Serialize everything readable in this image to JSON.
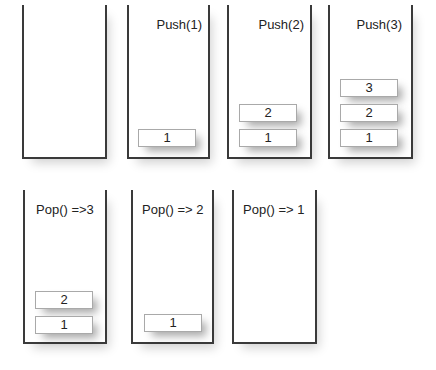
{
  "diagram": {
    "stacks": [
      {
        "label": "",
        "items": []
      },
      {
        "label": "Push(1)",
        "items": [
          "1"
        ]
      },
      {
        "label": "Push(2)",
        "items": [
          "2",
          "1"
        ]
      },
      {
        "label": "Push(3)",
        "items": [
          "3",
          "2",
          "1"
        ]
      },
      {
        "label": "Pop() =>3",
        "items": [
          "2",
          "1"
        ]
      },
      {
        "label": "Pop() => 2",
        "items": [
          "1"
        ]
      },
      {
        "label": "Pop() => 1",
        "items": []
      }
    ]
  }
}
